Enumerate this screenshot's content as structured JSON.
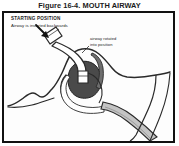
{
  "figure": {
    "caption": "Figure 16-4. MOUTH AIRWAY",
    "border_color": "#111111",
    "background_color": "#ffffff"
  },
  "annotations": {
    "starting_position": {
      "title": "STARTING POSITION",
      "subtitle": "Airway is inserted backwards"
    },
    "rotation_note": {
      "line1": "airway rotated",
      "line2": "into position"
    }
  },
  "illustration": {
    "name": "sagittal-head-airway-cross-section",
    "palette": {
      "outline": "#2a2a2a",
      "tongue_dark": "#4a4a4a",
      "pharynx_mid": "#9a9a9a",
      "trachea_light": "#c4c4c4",
      "skin_white": "#fbfbfb",
      "arrow": "#121212"
    },
    "parts": [
      "head-profile-outline",
      "nose",
      "lips",
      "tongue",
      "soft-palate",
      "pharynx",
      "trachea",
      "oropharyngeal-airway-device",
      "insertion-arrow"
    ]
  }
}
